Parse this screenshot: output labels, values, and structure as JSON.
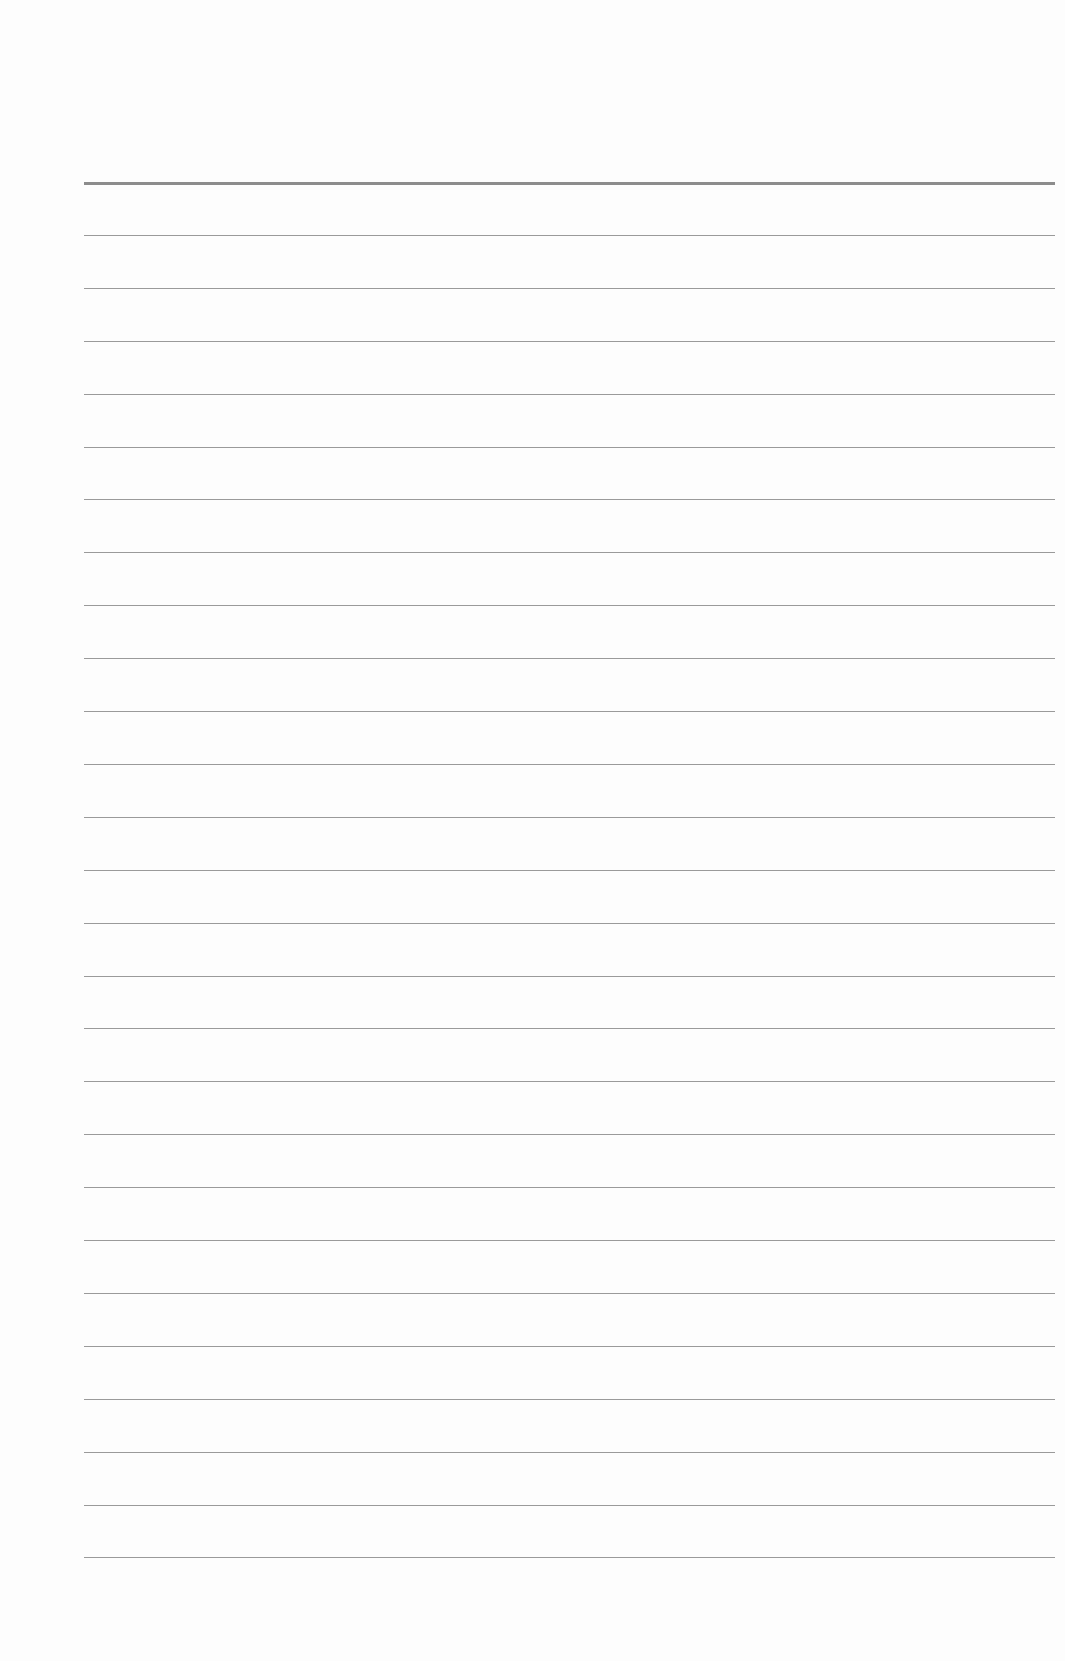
{
  "page": {
    "type": "lined-paper",
    "background_color": "#fdfdfd",
    "line_color": "#9a9a9a",
    "header_line_color": "#8c8c8c",
    "line_left_x": 84,
    "line_right_x": 1055,
    "first_line_y": 182,
    "line_spacing": 52.9,
    "line_count": 27
  }
}
